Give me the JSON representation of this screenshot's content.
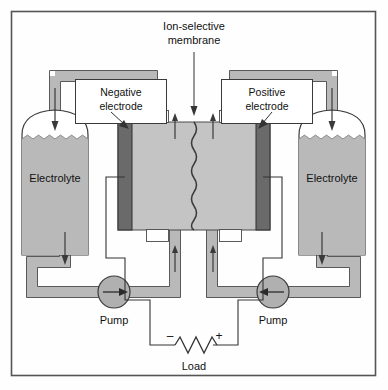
{
  "diagram": {
    "membrane_label": {
      "line1": "Ion-selective",
      "line2": "membrane"
    },
    "negative_electrode": {
      "line1": "Negative",
      "line2": "electrode"
    },
    "positive_electrode": {
      "line1": "Positive",
      "line2": "electrode"
    },
    "tanks": [
      {
        "id": "left-tank",
        "label": "Electrolyte"
      },
      {
        "id": "right-tank",
        "label": "Electrolyte"
      }
    ],
    "pumps": [
      {
        "id": "left-pump",
        "label": "Pump",
        "flow_direction": "right"
      },
      {
        "id": "right-pump",
        "label": "Pump",
        "flow_direction": "left"
      }
    ],
    "load": {
      "label": "Load",
      "negative_terminal": "–",
      "positive_terminal": "+"
    },
    "colors": {
      "fluid": "#b9b9b9",
      "fluid_stroke": "#555555",
      "electrode": "#6a6a6a",
      "electrode_stroke": "#2f2f2f",
      "cell_fill": "#c4c4c4",
      "tank_fill": "#ffffff",
      "outline": "#333333",
      "wire": "#333333",
      "background": "#fefefe",
      "border": "#555555"
    }
  }
}
